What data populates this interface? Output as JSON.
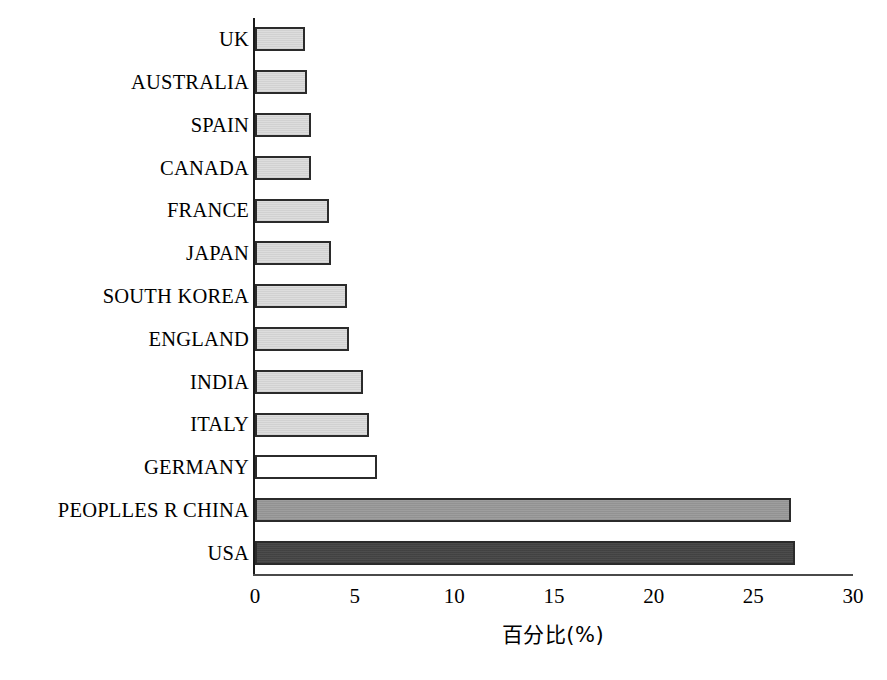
{
  "chart_data": {
    "type": "bar",
    "orientation": "horizontal",
    "title": "",
    "subtitle": "",
    "xlabel": "百分比(%)",
    "ylabel": "",
    "xlim": [
      0,
      30
    ],
    "xticks": [
      0,
      5,
      10,
      15,
      20,
      25,
      30
    ],
    "xtick_labels": [
      "0",
      "5",
      "10",
      "15",
      "20",
      "25",
      "30"
    ],
    "grid": false,
    "legend": false,
    "categories": [
      "UK",
      "AUSTRALIA",
      "SPAIN",
      "CANADA",
      "FRANCE",
      "JAPAN",
      "SOUTH KOREA",
      "ENGLAND",
      "INDIA",
      "ITALY",
      "GERMANY",
      "PEOPLLES R CHINA",
      "USA"
    ],
    "values": [
      2.5,
      2.6,
      2.8,
      2.8,
      3.7,
      3.8,
      4.6,
      4.7,
      5.4,
      5.7,
      6.1,
      26.9,
      27.1
    ],
    "bars": [
      {
        "label": "UK",
        "value": 2.5,
        "fill": "light",
        "fill_color": "#dcdcdc"
      },
      {
        "label": "AUSTRALIA",
        "value": 2.6,
        "fill": "light",
        "fill_color": "#dcdcdc"
      },
      {
        "label": "SPAIN",
        "value": 2.8,
        "fill": "light",
        "fill_color": "#dcdcdc"
      },
      {
        "label": "CANADA",
        "value": 2.8,
        "fill": "light",
        "fill_color": "#dcdcdc"
      },
      {
        "label": "FRANCE",
        "value": 3.7,
        "fill": "light",
        "fill_color": "#dcdcdc"
      },
      {
        "label": "JAPAN",
        "value": 3.8,
        "fill": "light",
        "fill_color": "#dcdcdc"
      },
      {
        "label": "SOUTH KOREA",
        "value": 4.6,
        "fill": "light",
        "fill_color": "#dcdcdc"
      },
      {
        "label": "ENGLAND",
        "value": 4.7,
        "fill": "light",
        "fill_color": "#dcdcdc"
      },
      {
        "label": "INDIA",
        "value": 5.4,
        "fill": "light",
        "fill_color": "#dcdcdc"
      },
      {
        "label": "ITALY",
        "value": 5.7,
        "fill": "light",
        "fill_color": "#dcdcdc"
      },
      {
        "label": "GERMANY",
        "value": 6.1,
        "fill": "white",
        "fill_color": "#ffffff"
      },
      {
        "label": "PEOPLLES R CHINA",
        "value": 26.9,
        "fill": "mid",
        "fill_color": "#9a9a9a"
      },
      {
        "label": "USA",
        "value": 27.1,
        "fill": "dark",
        "fill_color": "#454545"
      }
    ],
    "colors": {
      "bar_outline": "#2b2b2b",
      "axis": "#1a1a1a",
      "light": "#dcdcdc",
      "white": "#ffffff",
      "mid": "#9a9a9a",
      "dark": "#454545"
    }
  }
}
